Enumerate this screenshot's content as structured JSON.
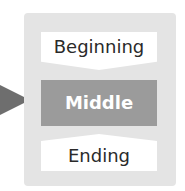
{
  "diagram": {
    "stages": [
      {
        "label": "Beginning",
        "highlighted": false
      },
      {
        "label": "Middle",
        "highlighted": true
      },
      {
        "label": "Ending",
        "highlighted": false
      }
    ],
    "pointer": {
      "icon": "triangle-right-icon",
      "points_to": "Middle"
    },
    "colors": {
      "panel": "#e4e4e4",
      "stage_normal": "#ffffff",
      "stage_highlight": "#9b9b9b",
      "pointer": "#6e6e6e",
      "text_normal": "#2a2a2a",
      "text_highlight": "#ffffff"
    }
  }
}
